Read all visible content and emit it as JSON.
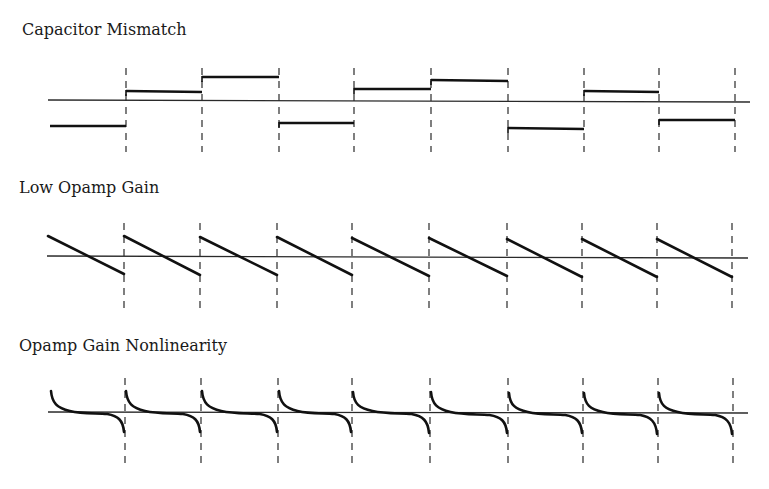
{
  "panels": [
    {
      "title": "Capacitor Mismatch",
      "title_pos": [
        22,
        22
      ],
      "type": "step",
      "axis": {
        "x1": 48,
        "y1": 100,
        "x2": 750,
        "y2": 102
      },
      "dash": {
        "y1": 68,
        "y2": 152
      },
      "boundaries": [
        126,
        202,
        279,
        354,
        431,
        508,
        584,
        659,
        735
      ],
      "segments": [
        {
          "x1": 50,
          "x2": 126,
          "y1": 126,
          "y2": 126
        },
        {
          "x1": 126,
          "x2": 202,
          "y1": 91,
          "y2": 92
        },
        {
          "x1": 202,
          "x2": 279,
          "y1": 77,
          "y2": 77
        },
        {
          "x1": 279,
          "x2": 354,
          "y1": 123,
          "y2": 123
        },
        {
          "x1": 354,
          "x2": 431,
          "y1": 89,
          "y2": 89
        },
        {
          "x1": 431,
          "x2": 508,
          "y1": 80,
          "y2": 81
        },
        {
          "x1": 508,
          "x2": 584,
          "y1": 128,
          "y2": 129
        },
        {
          "x1": 584,
          "x2": 659,
          "y1": 91,
          "y2": 92
        },
        {
          "x1": 659,
          "x2": 735,
          "y1": 120,
          "y2": 120
        }
      ]
    },
    {
      "title": "Low Opamp Gain",
      "title_pos": [
        19,
        180
      ],
      "type": "sawtooth",
      "axis": {
        "x1": 47,
        "y1": 256,
        "x2": 748,
        "y2": 258
      },
      "dash": {
        "y1": 223,
        "y2": 308
      },
      "boundaries": [
        124,
        200,
        277,
        352,
        429,
        507,
        582,
        657,
        732
      ],
      "segments": [
        {
          "x1": 48,
          "x2": 124,
          "y1": 236,
          "y2": 274
        },
        {
          "x1": 124,
          "x2": 200,
          "y1": 236,
          "y2": 275
        },
        {
          "x1": 200,
          "x2": 277,
          "y1": 237,
          "y2": 275
        },
        {
          "x1": 277,
          "x2": 352,
          "y1": 237,
          "y2": 275
        },
        {
          "x1": 352,
          "x2": 429,
          "y1": 238,
          "y2": 276
        },
        {
          "x1": 429,
          "x2": 507,
          "y1": 238,
          "y2": 276
        },
        {
          "x1": 507,
          "x2": 582,
          "y1": 239,
          "y2": 277
        },
        {
          "x1": 582,
          "x2": 657,
          "y1": 239,
          "y2": 277
        },
        {
          "x1": 657,
          "x2": 732,
          "y1": 239,
          "y2": 277
        }
      ]
    },
    {
      "title": "Opamp Gain Nonlinearity",
      "title_pos": [
        19,
        338
      ],
      "type": "nonlinear",
      "axis": {
        "x1": 48,
        "y1": 412,
        "x2": 748,
        "y2": 413
      },
      "dash": {
        "y1": 378,
        "y2": 464
      },
      "boundaries": [
        125,
        201,
        278,
        352,
        430,
        508,
        583,
        658,
        733
      ],
      "segments": [
        {
          "x1": 50,
          "x2": 125,
          "ytop": 391,
          "ymid": 412,
          "ybot": 432
        },
        {
          "x1": 125,
          "x2": 201,
          "ytop": 391,
          "ymid": 412,
          "ybot": 432
        },
        {
          "x1": 201,
          "x2": 278,
          "ytop": 391,
          "ymid": 412,
          "ybot": 432
        },
        {
          "x1": 278,
          "x2": 352,
          "ytop": 391,
          "ymid": 412,
          "ybot": 432
        },
        {
          "x1": 352,
          "x2": 430,
          "ytop": 392,
          "ymid": 412,
          "ybot": 433
        },
        {
          "x1": 430,
          "x2": 508,
          "ytop": 392,
          "ymid": 413,
          "ybot": 433
        },
        {
          "x1": 508,
          "x2": 583,
          "ytop": 393,
          "ymid": 413,
          "ybot": 433
        },
        {
          "x1": 583,
          "x2": 658,
          "ytop": 393,
          "ymid": 413,
          "ybot": 434
        },
        {
          "x1": 658,
          "x2": 733,
          "ytop": 393,
          "ymid": 413,
          "ybot": 434
        }
      ]
    }
  ],
  "colors": {
    "background": "#ffffff",
    "axis": "#2a2a2a",
    "trace": "#111111",
    "dash": "#2a2a2a",
    "text": "#1a1a1a"
  }
}
